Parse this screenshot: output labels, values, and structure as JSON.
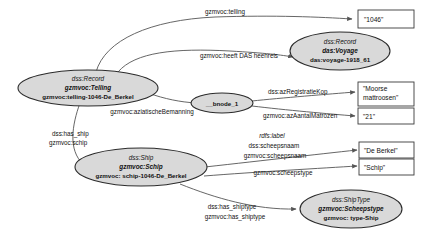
{
  "diagram": {
    "colors": {
      "ellipse_fill": "#d9d9d9",
      "ellipse_stroke": "#2b2b2b",
      "rect_fill": "#ffffff",
      "rect_stroke": "#3a3a3a",
      "edge_stroke": "#555555",
      "background": "#ffffff"
    }
  },
  "nodes": {
    "record_telling": {
      "line1": "dss:Record",
      "line2": "gzmvoc:Telling",
      "line3": "gzmvoc:telling-1046-De_Berkel"
    },
    "record_voyage": {
      "line1": "dss:Record",
      "line2": "das:Voyage",
      "line3": "das:voyage-1918_61"
    },
    "bnode": {
      "label": "__bnode_1"
    },
    "ship": {
      "line1": "dss:Ship",
      "line2": "gzmvoc:Schip",
      "line3": "gzmvoc: schip-1046-De_Berkel"
    },
    "shiptype": {
      "line1": "dss:ShipType",
      "line2": "gzmvoc:Scheepstype",
      "line3": "gzmvoc: type-Ship"
    }
  },
  "literals": {
    "count_1046": {
      "value": "\"1046\""
    },
    "moorse": {
      "line1": "\"Moorse",
      "line2": "mattroosen\""
    },
    "twentyone": {
      "value": "\"21\""
    },
    "de_berkel": {
      "value": "\"De Berkel\""
    },
    "schip": {
      "value": "\"Schip\""
    }
  },
  "edge_labels": {
    "telling": "gzmvoc:telling",
    "heeft_das_heenreis": "gzmvoc:heeft DAS heenreis",
    "aziatische_bemanning": "gzmvoc:aziatischeBemanning",
    "az_registratie_kop": "dss:azRegistratieKop",
    "az_aantal_matrozen": "gzmvoc:azAantalMatrozen",
    "has_ship": "dss:has_ship",
    "schip": "gzmvoc:schip",
    "rdfs_label": "rdfs:label",
    "dss_scheepsnaam": "dss:scheepsnaam",
    "gzmvoc_scheepsnaam": "gzmvoc:scheepsnaam",
    "gzmvoc_scheepstype": "gzmvoc:scheepstype",
    "dss_has_shiptype": "dss:has_shiptype",
    "gzmvoc_has_shiptype": "gzmvoc:has_shiptype"
  }
}
